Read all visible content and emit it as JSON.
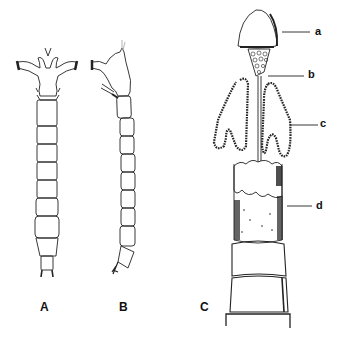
{
  "figure": {
    "panels": [
      {
        "id": "A",
        "label": "A",
        "description": "larva, dorsal view"
      },
      {
        "id": "B",
        "label": "B",
        "description": "larva, lateral view"
      },
      {
        "id": "C",
        "label": "C",
        "description": "detail of anterior body"
      }
    ],
    "part_labels": [
      {
        "id": "a",
        "label": "a"
      },
      {
        "id": "b",
        "label": "b"
      },
      {
        "id": "c",
        "label": "c"
      },
      {
        "id": "d",
        "label": "d"
      }
    ]
  }
}
